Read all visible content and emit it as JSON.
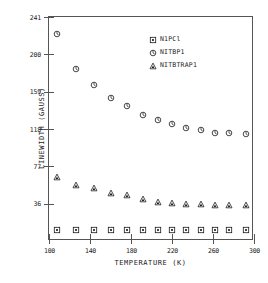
{
  "chart_data": {
    "type": "scatter",
    "title": "",
    "xlabel": "TEMPERATURE (K)",
    "ylabel": "LINEWIDTH (GAUSS)",
    "xlim": [
      100,
      300
    ],
    "ylim": [
      -5,
      241
    ],
    "xticks": [
      100,
      140,
      180,
      220,
      260,
      300
    ],
    "yticks": [
      36,
      77,
      118,
      159,
      200,
      241
    ],
    "grid": false,
    "legend_position": "top-right",
    "marker_color": "#1a1a1a",
    "axis_color": "#555555",
    "series": [
      {
        "name": "N1PCl",
        "marker": "square",
        "x": [
          108,
          126,
          144,
          160,
          176,
          192,
          206,
          220,
          234,
          248,
          262,
          276,
          292
        ],
        "y": [
          7,
          7,
          7,
          7,
          7,
          7,
          7,
          7,
          7,
          7,
          7,
          7,
          7
        ]
      },
      {
        "name": "NITBP1",
        "marker": "circle",
        "x": [
          108,
          126,
          144,
          160,
          176,
          192,
          206,
          220,
          234,
          248,
          262,
          276,
          292
        ],
        "y": [
          222,
          184,
          166,
          152,
          143,
          133,
          128,
          124,
          119,
          117,
          114,
          114,
          112
        ]
      },
      {
        "name": "NITBTRAP1",
        "marker": "triangle",
        "x": [
          108,
          126,
          144,
          160,
          176,
          192,
          206,
          220,
          234,
          248,
          262,
          276,
          292
        ],
        "y": [
          65,
          57,
          53,
          48,
          45,
          41,
          38,
          37,
          36,
          36,
          35,
          35,
          35
        ]
      }
    ]
  }
}
